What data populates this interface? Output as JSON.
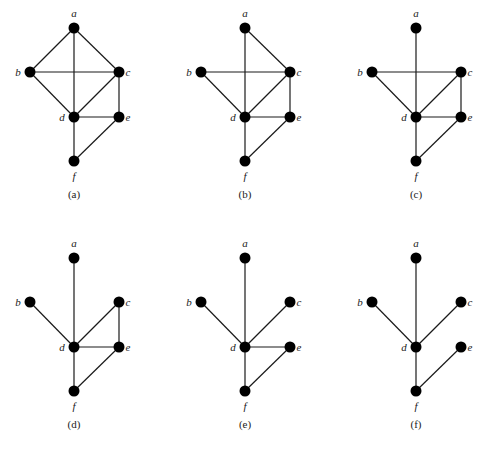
{
  "figure": {
    "panels": [
      {
        "caption": "(a)",
        "offset": [
          0,
          0
        ],
        "vertices": [
          "a",
          "b",
          "c",
          "d",
          "e",
          "f"
        ],
        "edges": [
          [
            "a",
            "b"
          ],
          [
            "a",
            "c"
          ],
          [
            "a",
            "d"
          ],
          [
            "b",
            "c"
          ],
          [
            "b",
            "d"
          ],
          [
            "c",
            "d"
          ],
          [
            "c",
            "e"
          ],
          [
            "d",
            "e"
          ],
          [
            "d",
            "f"
          ],
          [
            "e",
            "f"
          ]
        ]
      },
      {
        "caption": "(b)",
        "offset": [
          171,
          0
        ],
        "vertices": [
          "a",
          "b",
          "c",
          "d",
          "e",
          "f"
        ],
        "edges": [
          [
            "a",
            "c"
          ],
          [
            "a",
            "d"
          ],
          [
            "b",
            "c"
          ],
          [
            "b",
            "d"
          ],
          [
            "c",
            "d"
          ],
          [
            "c",
            "e"
          ],
          [
            "d",
            "e"
          ],
          [
            "d",
            "f"
          ],
          [
            "e",
            "f"
          ]
        ]
      },
      {
        "caption": "(c)",
        "offset": [
          342,
          0
        ],
        "vertices": [
          "a",
          "b",
          "c",
          "d",
          "e",
          "f"
        ],
        "edges": [
          [
            "a",
            "d"
          ],
          [
            "b",
            "c"
          ],
          [
            "b",
            "d"
          ],
          [
            "c",
            "d"
          ],
          [
            "c",
            "e"
          ],
          [
            "d",
            "e"
          ],
          [
            "d",
            "f"
          ],
          [
            "e",
            "f"
          ]
        ]
      },
      {
        "caption": "(d)",
        "offset": [
          0,
          230
        ],
        "vertices": [
          "a",
          "b",
          "c",
          "d",
          "e",
          "f"
        ],
        "edges": [
          [
            "a",
            "d"
          ],
          [
            "b",
            "d"
          ],
          [
            "c",
            "d"
          ],
          [
            "c",
            "e"
          ],
          [
            "d",
            "e"
          ],
          [
            "d",
            "f"
          ],
          [
            "e",
            "f"
          ]
        ]
      },
      {
        "caption": "(e)",
        "offset": [
          171,
          230
        ],
        "vertices": [
          "a",
          "b",
          "c",
          "d",
          "e",
          "f"
        ],
        "edges": [
          [
            "a",
            "d"
          ],
          [
            "b",
            "d"
          ],
          [
            "c",
            "d"
          ],
          [
            "d",
            "e"
          ],
          [
            "d",
            "f"
          ],
          [
            "e",
            "f"
          ]
        ]
      },
      {
        "caption": "(f)",
        "offset": [
          342,
          230
        ],
        "vertices": [
          "a",
          "b",
          "c",
          "d",
          "e",
          "f"
        ],
        "edges": [
          [
            "a",
            "d"
          ],
          [
            "b",
            "d"
          ],
          [
            "c",
            "d"
          ],
          [
            "d",
            "f"
          ],
          [
            "e",
            "f"
          ]
        ]
      }
    ],
    "base_positions": {
      "a": [
        74,
        28
      ],
      "b": [
        30,
        72
      ],
      "c": [
        119,
        72
      ],
      "d": [
        74,
        117
      ],
      "e": [
        119,
        117
      ],
      "f": [
        74,
        161
      ]
    },
    "label_offsets": {
      "a": [
        0,
        -11
      ],
      "b": [
        -12,
        4
      ],
      "c": [
        9,
        4
      ],
      "d": [
        -12,
        4
      ],
      "e": [
        9,
        4
      ],
      "f": [
        0,
        19
      ]
    },
    "caption_y": 198
  }
}
